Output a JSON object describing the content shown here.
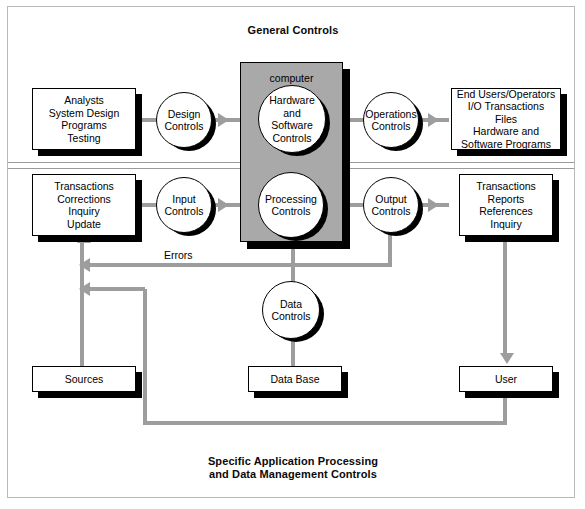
{
  "diagram": {
    "title_top": "General Controls",
    "title_bottom_line1": "Specific Application Processing",
    "title_bottom_line2": "and Data Management Controls",
    "computer_label": "computer",
    "errors_label": "Errors",
    "colors": {
      "connector_gray": "#9d9d9d",
      "computer_fill": "#a9a9a9",
      "frame_border": "#b9b9b9",
      "shape_stroke": "#000000",
      "band_rule": "#9a9a9a"
    }
  },
  "general_controls": {
    "input_box": "Analysts\nSystem Design\nPrograms\nTesting",
    "design_controls": "Design\nControls",
    "hardware_software_controls": "Hardware\nand\nSoftware\nControls",
    "operations_controls": "Operations\nControls",
    "output_box": "End Users/Operators\nI/O Transactions\nFiles\nHardware and\nSoftware Programs"
  },
  "application_controls": {
    "input_box": "Transactions\nCorrections\nInquiry\nUpdate",
    "input_controls": "Input\nControls",
    "processing_controls": "Processing\nControls",
    "output_controls": "Output\nControls",
    "output_box": "Transactions\nReports\nReferences\nInquiry",
    "data_controls": "Data\nControls",
    "sources": "Sources",
    "data_base": "Data Base",
    "user": "User"
  }
}
